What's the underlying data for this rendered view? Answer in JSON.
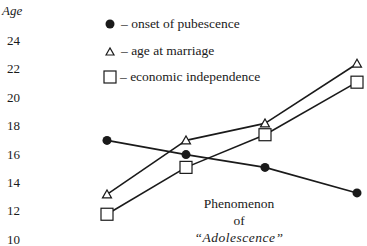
{
  "chart_data": {
    "type": "line",
    "title": "",
    "xlabel": "",
    "ylabel": "Age",
    "ylim": [
      10,
      24
    ],
    "yticks": [
      "24",
      "22",
      "20",
      "18",
      "16",
      "14",
      "12",
      "10"
    ],
    "ytick_values": [
      24,
      22,
      20,
      18,
      16,
      14,
      12,
      10
    ],
    "x": [
      1,
      2,
      3,
      4
    ],
    "grid": false,
    "legend_position": "top-right",
    "series": [
      {
        "name": "onset of pubescence",
        "marker": "filled-circle",
        "label": "– onset of pubescence",
        "values": [
          17.0,
          16.0,
          15.1,
          13.3
        ]
      },
      {
        "name": "age at marriage",
        "marker": "open-triangle",
        "label": "– age at marriage",
        "values": [
          13.2,
          17.0,
          18.2,
          22.4
        ]
      },
      {
        "name": "economic independence",
        "marker": "open-square",
        "label": "– economic independence",
        "values": [
          11.8,
          15.1,
          17.4,
          21.1
        ]
      }
    ],
    "annotation": {
      "line1": "Phenomenon",
      "line2": "of",
      "line3": "“Adolescence”"
    },
    "colors": {
      "ink": "#1a1a1a",
      "background": "#ffffff"
    }
  }
}
